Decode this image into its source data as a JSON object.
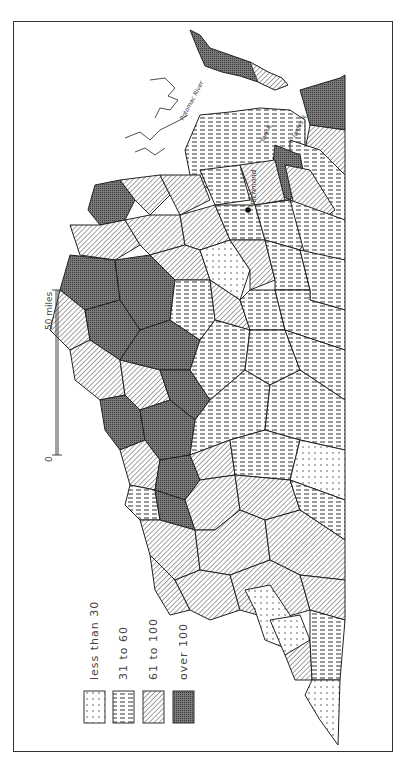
{
  "map": {
    "orientation": "rotated 90° counter-clockwise (north to the left)",
    "region": "Virginia counties",
    "city_label": "Richmond",
    "river_labels": [
      "Potomac River",
      "York R.",
      "James R."
    ],
    "scale": {
      "start_label": "0",
      "end_label": "50 miles"
    }
  },
  "legend": {
    "items": [
      {
        "label": "less than 30",
        "pattern": "dots"
      },
      {
        "label": "31 to 60",
        "pattern": "horizontal-dashes"
      },
      {
        "label": "61 to 100",
        "pattern": "diagonal-hatch"
      },
      {
        "label": "over 100",
        "pattern": "dense-crosshatch"
      }
    ]
  },
  "colors": {
    "ink": "#2a2a2a",
    "paper": "#ffffff",
    "dark_fill": "#6a6a6a"
  }
}
